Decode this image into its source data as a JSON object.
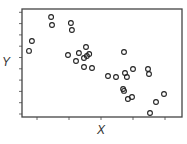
{
  "chart_data": {
    "type": "scatter",
    "title": "",
    "xlabel": "X",
    "ylabel": "Y",
    "x_ticks": [
      1,
      2,
      3,
      4,
      5
    ],
    "y_ticks": [
      1,
      2,
      3,
      4,
      5,
      6,
      7,
      8,
      9,
      10
    ],
    "tick_labels_shown": false,
    "grid": false,
    "legend": null,
    "marker": "open-circle",
    "xlim": [
      0.53,
      5.53
    ],
    "ylim": [
      0.73,
      10.29
    ],
    "series": [
      {
        "name": "points",
        "x": [
          1.44,
          1.47,
          2.06,
          2.09,
          0.84,
          0.75,
          1.97,
          2.31,
          2.53,
          2.22,
          2.47,
          2.56,
          2.63,
          2.47,
          2.72,
          3.72,
          3.22,
          3.47,
          3.75,
          3.81,
          4.0,
          4.47,
          4.5,
          3.69,
          3.72,
          3.84,
          3.97,
          4.72,
          4.97,
          4.53
        ],
        "y": [
          9.58,
          8.88,
          9.05,
          8.43,
          7.46,
          6.58,
          6.22,
          6.4,
          6.93,
          5.69,
          5.96,
          6.13,
          6.31,
          5.16,
          5.07,
          6.49,
          4.36,
          4.27,
          4.63,
          4.27,
          4.98,
          4.98,
          4.54,
          3.21,
          3.04,
          2.33,
          2.5,
          2.06,
          2.77,
          1.09
        ]
      }
    ]
  },
  "style": {
    "frame_color": "#444444",
    "marker_color": "#222222",
    "label_color": "#333333"
  }
}
